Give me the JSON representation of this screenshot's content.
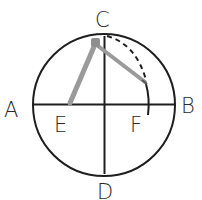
{
  "diagram": {
    "points": {
      "A": {
        "label": "A"
      },
      "B": {
        "label": "B"
      },
      "C": {
        "label": "C"
      },
      "D": {
        "label": "D"
      },
      "E": {
        "label": "E"
      },
      "F": {
        "label": "F"
      }
    },
    "colors": {
      "stroke": "#1e1e1e",
      "compass": "#9a9a9a",
      "background": "#ffffff"
    }
  }
}
